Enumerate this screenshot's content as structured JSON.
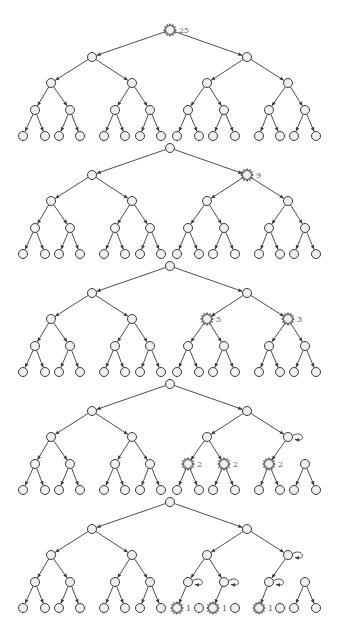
{
  "diagram": {
    "title": "",
    "colors": {
      "stroke": "#3a3a3a",
      "node_fill": "#f0f0f0",
      "label": "#555555",
      "background": "#ffffff"
    },
    "node_radius": 4.5,
    "layout": {
      "x_by_level": [
        [
          170
        ],
        [
          92,
          247
        ],
        [
          51,
          132,
          207,
          288
        ],
        [
          35,
          70,
          115,
          150,
          188,
          224,
          269,
          305
        ],
        [
          23,
          45,
          59,
          80,
          104,
          125,
          140,
          161,
          177,
          199,
          213,
          235,
          259,
          280,
          294,
          316
        ]
      ],
      "level_dy": [
        0,
        27,
        53,
        80,
        106
      ]
    },
    "trees": [
      {
        "name": "tree-1",
        "root_y": 30,
        "highlighted": [
          {
            "level": 0,
            "index": 0,
            "label": "25"
          }
        ],
        "self_loops": [],
        "pruned_edges": []
      },
      {
        "name": "tree-2",
        "root_y": 148,
        "highlighted": [
          {
            "level": 1,
            "index": 1,
            "label": "9"
          }
        ],
        "self_loops": [],
        "pruned_edges": []
      },
      {
        "name": "tree-3",
        "root_y": 266,
        "highlighted": [
          {
            "level": 2,
            "index": 2,
            "label": "5"
          },
          {
            "level": 2,
            "index": 3,
            "label": "3"
          }
        ],
        "self_loops": [],
        "pruned_edges": []
      },
      {
        "name": "tree-4",
        "root_y": 384,
        "highlighted": [
          {
            "level": 3,
            "index": 4,
            "label": "2"
          },
          {
            "level": 3,
            "index": 5,
            "label": "2"
          },
          {
            "level": 3,
            "index": 6,
            "label": "2"
          }
        ],
        "self_loops": [
          {
            "level": 2,
            "index": 3
          }
        ],
        "pruned_edges": [
          {
            "level": 2,
            "index": 3,
            "child": 1
          }
        ]
      },
      {
        "name": "tree-5",
        "root_y": 502,
        "highlighted": [
          {
            "level": 4,
            "index": 8,
            "label": "1"
          },
          {
            "level": 4,
            "index": 10,
            "label": "1"
          },
          {
            "level": 4,
            "index": 12,
            "label": "1"
          }
        ],
        "self_loops": [
          {
            "level": 2,
            "index": 3
          },
          {
            "level": 3,
            "index": 4
          },
          {
            "level": 3,
            "index": 5
          },
          {
            "level": 3,
            "index": 6
          }
        ],
        "pruned_edges": [
          {
            "level": 2,
            "index": 3,
            "child": 1
          },
          {
            "level": 3,
            "index": 4,
            "child": 1
          },
          {
            "level": 3,
            "index": 5,
            "child": 1
          },
          {
            "level": 3,
            "index": 6,
            "child": 1
          }
        ]
      }
    ]
  }
}
